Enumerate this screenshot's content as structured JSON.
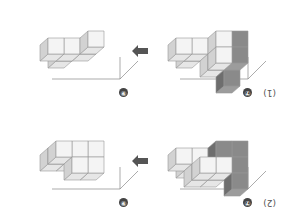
{
  "orientation": "rotated-180",
  "problems": [
    {
      "label": "(1)",
      "before_marker": "⑦",
      "after_marker": "⑨",
      "arrow": "left-arrow",
      "before": {
        "light_cubes": 6,
        "dark_cubes": 3
      },
      "after": {
        "light_cubes": 5,
        "dark_cubes": 0
      }
    },
    {
      "label": "(2)",
      "before_marker": "⑦",
      "after_marker": "⑨",
      "arrow": "left-arrow",
      "before": {
        "light_cubes": 8,
        "dark_cubes": 6
      },
      "after": {
        "light_cubes": 8,
        "dark_cubes": 0
      }
    }
  ],
  "colors": {
    "light_face": "#f4f4f4",
    "light_side": "#d2d2d2",
    "light_top": "#e6e6e6",
    "dark_face": "#8a8a8a",
    "dark_side": "#6e6e6e",
    "dark_top": "#9c9c9c",
    "edge": "#999999",
    "arrow": "#555555"
  }
}
